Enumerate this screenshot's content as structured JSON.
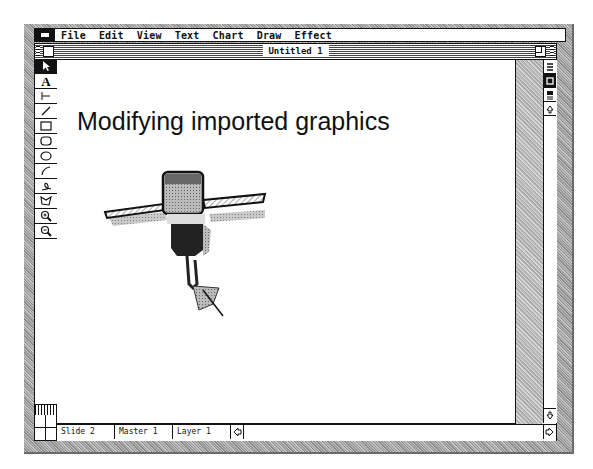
{
  "menubar": {
    "apple_icon": "apple-menu-icon",
    "items": [
      "File",
      "Edit",
      "View",
      "Text",
      "Chart",
      "Draw",
      "Effect"
    ]
  },
  "window": {
    "title": "Untitled 1",
    "close_box": "close-box-icon",
    "zoom_box": "zoom-box-icon"
  },
  "tools": [
    {
      "name": "pointer",
      "icon": "arrow-pointer-icon",
      "active": true
    },
    {
      "name": "text",
      "icon": "text-tool-icon",
      "glyph": "A"
    },
    {
      "name": "orthogonal-line",
      "icon": "perpendicular-line-icon"
    },
    {
      "name": "diagonal-line",
      "icon": "diagonal-line-icon"
    },
    {
      "name": "rectangle",
      "icon": "rectangle-icon"
    },
    {
      "name": "rounded-rectangle",
      "icon": "rounded-rectangle-icon"
    },
    {
      "name": "oval",
      "icon": "oval-icon"
    },
    {
      "name": "arc",
      "icon": "arc-icon"
    },
    {
      "name": "freehand",
      "icon": "freehand-icon"
    },
    {
      "name": "polygon",
      "icon": "polygon-icon"
    },
    {
      "name": "zoom-in",
      "icon": "zoom-in-icon"
    },
    {
      "name": "zoom-out",
      "icon": "zoom-out-icon"
    }
  ],
  "slide": {
    "title": "Modifying imported graphics",
    "graphic": "satellite-clipart"
  },
  "view_buttons": [
    "slide-view-icon",
    "slide-sorter-icon",
    "notes-view-icon",
    "scroll-up-icon"
  ],
  "statusbar": {
    "slide": "Slide  2",
    "master": "Master 1",
    "layer": "Layer 1"
  }
}
